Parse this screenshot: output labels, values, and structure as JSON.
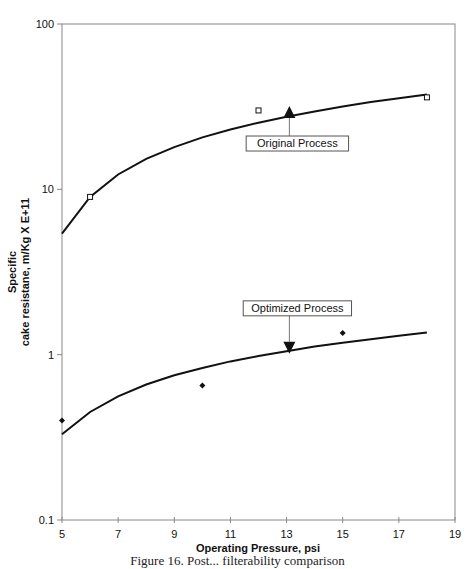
{
  "chart_data": {
    "type": "line",
    "title": "",
    "xlabel": "Operating Pressure, psi",
    "ylabel_line1": "Specific",
    "ylabel_line2": "cake resistane, m/Kg X E+11",
    "xlim": [
      5,
      19
    ],
    "ylim": [
      0.1,
      100
    ],
    "yscale": "log",
    "x_ticks": [
      5,
      7,
      9,
      11,
      13,
      15,
      17,
      19
    ],
    "y_ticks": [
      0.1,
      1,
      10,
      100
    ],
    "y_tick_labels": [
      "0.1",
      "1",
      "10",
      "100"
    ],
    "grid": false,
    "legend": null,
    "series": [
      {
        "name": "Original Process",
        "marker": "open-square",
        "points": [
          {
            "x": 6,
            "y": 9
          },
          {
            "x": 12,
            "y": 30
          },
          {
            "x": 18,
            "y": 36
          }
        ],
        "fit_curve": [
          {
            "x": 5,
            "y": 5.4
          },
          {
            "x": 6,
            "y": 9.0
          },
          {
            "x": 7,
            "y": 12.3
          },
          {
            "x": 8,
            "y": 15.3
          },
          {
            "x": 9,
            "y": 18.0
          },
          {
            "x": 10,
            "y": 20.6
          },
          {
            "x": 11,
            "y": 23.0
          },
          {
            "x": 12,
            "y": 25.3
          },
          {
            "x": 13,
            "y": 27.5
          },
          {
            "x": 14,
            "y": 29.6
          },
          {
            "x": 15,
            "y": 31.7
          },
          {
            "x": 16,
            "y": 33.7
          },
          {
            "x": 17,
            "y": 35.6
          },
          {
            "x": 18,
            "y": 37.5
          }
        ]
      },
      {
        "name": "Optimized Process",
        "marker": "filled-diamond",
        "points": [
          {
            "x": 5,
            "y": 0.4
          },
          {
            "x": 10,
            "y": 0.65
          },
          {
            "x": 15,
            "y": 1.35
          }
        ],
        "fit_curve": [
          {
            "x": 5,
            "y": 0.33
          },
          {
            "x": 6,
            "y": 0.45
          },
          {
            "x": 7,
            "y": 0.56
          },
          {
            "x": 8,
            "y": 0.66
          },
          {
            "x": 9,
            "y": 0.75
          },
          {
            "x": 10,
            "y": 0.83
          },
          {
            "x": 11,
            "y": 0.91
          },
          {
            "x": 12,
            "y": 0.98
          },
          {
            "x": 13,
            "y": 1.05
          },
          {
            "x": 14,
            "y": 1.12
          },
          {
            "x": 15,
            "y": 1.18
          },
          {
            "x": 16,
            "y": 1.24
          },
          {
            "x": 17,
            "y": 1.3
          },
          {
            "x": 18,
            "y": 1.36
          }
        ]
      }
    ],
    "annotations": [
      {
        "text": "Original Process",
        "arrow": "up",
        "x": 13.1,
        "y": 27
      },
      {
        "text": "Optimized Process",
        "arrow": "down",
        "x": 13.1,
        "y": 1.1
      }
    ]
  },
  "caption": "Figure 16. Post... filterability comparison"
}
